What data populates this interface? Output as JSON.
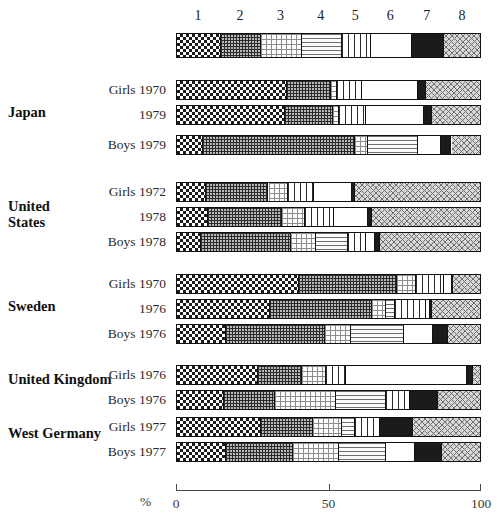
{
  "axis": {
    "unit_label": "%",
    "ticks": [
      {
        "label": "0",
        "value": 0
      },
      {
        "label": "50",
        "value": 50
      },
      {
        "label": "100",
        "value": 100
      }
    ],
    "min": 0,
    "max": 100
  },
  "legend": {
    "numbers": [
      "1",
      "2",
      "3",
      "4",
      "5",
      "6",
      "7",
      "8"
    ],
    "patterns": [
      "checkerboard",
      "fine-grid",
      "sparse-dots",
      "horizontal-dashes",
      "vertical-stripes",
      "white",
      "solid-black",
      "diagonal-hatch"
    ],
    "widths": [
      14.5,
      13.0,
      13.5,
      13.0,
      9.5,
      13.5,
      10.5,
      12.5
    ]
  },
  "groups": [
    {
      "country": "Japan",
      "rows": [
        {
          "label": "Girls 1970",
          "values": [
            36.0,
            14.5,
            2.0,
            0.0,
            8.0,
            18.5,
            2.5,
            18.5
          ]
        },
        {
          "label": "1979",
          "values": [
            35.5,
            15.5,
            2.0,
            0.0,
            9.0,
            19.0,
            2.5,
            16.5
          ]
        },
        {
          "label": "Boys 1979",
          "values": [
            8.5,
            50.0,
            4.0,
            16.5,
            0.0,
            7.5,
            3.5,
            10.0
          ]
        }
      ]
    },
    {
      "country": "United\nStates",
      "rows": [
        {
          "label": "Girls 1972",
          "values": [
            9.5,
            20.5,
            6.5,
            0.0,
            8.5,
            12.5,
            1.0,
            41.5
          ]
        },
        {
          "label": "1978",
          "values": [
            10.0,
            24.5,
            7.5,
            0.0,
            9.5,
            11.0,
            1.5,
            36.0
          ]
        },
        {
          "label": "Boys 1978",
          "values": [
            8.0,
            29.5,
            8.0,
            10.5,
            6.0,
            3.0,
            1.5,
            33.5
          ]
        }
      ]
    },
    {
      "country": "Sweden",
      "rows": [
        {
          "label": "Girls 1970",
          "values": [
            40.0,
            32.0,
            6.5,
            0.0,
            9.0,
            2.5,
            0.5,
            9.5
          ]
        },
        {
          "label": "1976",
          "values": [
            30.5,
            33.5,
            4.5,
            3.0,
            10.0,
            1.5,
            0.5,
            16.5
          ]
        },
        {
          "label": "Boys 1976",
          "values": [
            16.0,
            32.5,
            8.5,
            17.5,
            0.0,
            9.5,
            5.0,
            11.0
          ]
        }
      ]
    },
    {
      "country": "United Kingdom",
      "rows": [
        {
          "label": "Girls 1976",
          "values": [
            26.5,
            14.5,
            8.0,
            0.0,
            6.5,
            39.5,
            2.0,
            3.0
          ]
        },
        {
          "label": "Boys 1976",
          "values": [
            15.5,
            16.5,
            20.0,
            16.5,
            8.0,
            0.0,
            9.0,
            14.5
          ]
        }
      ]
    },
    {
      "country": "West Germany",
      "rows": [
        {
          "label": "Girls 1977",
          "values": [
            27.5,
            17.0,
            9.5,
            4.5,
            8.0,
            0.0,
            11.0,
            22.5
          ]
        },
        {
          "label": "Boys 1977",
          "values": [
            16.0,
            22.0,
            15.0,
            15.5,
            0.0,
            9.5,
            9.0,
            13.0
          ]
        }
      ]
    }
  ]
}
